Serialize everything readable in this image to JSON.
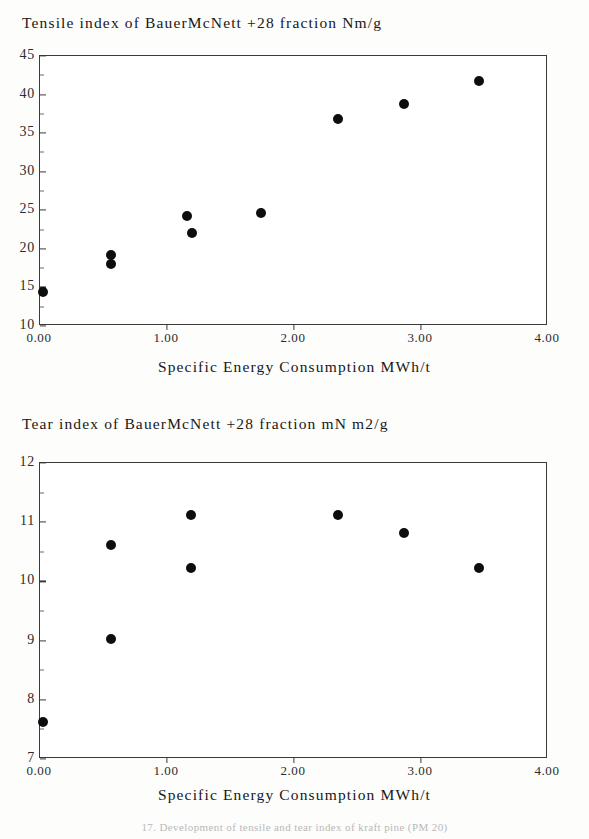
{
  "document": {
    "figure_caption": "17.  Development of tensile and tear index of kraft pine (PM 20)"
  },
  "charts": [
    {
      "id": "tensile",
      "title": "Tensile index of BauerMcNett +28 fraction Nm/g",
      "xlabel": "Specific Energy Consumption MWh/t",
      "yticks": [
        "45",
        "40",
        "35",
        "30",
        "25",
        "20",
        "15",
        "10"
      ],
      "xticks": [
        "0.00",
        "1.00",
        "2.00",
        "3.00",
        "4.00"
      ]
    },
    {
      "id": "tear",
      "title": "Tear index of BauerMcNett +28 fraction mN m2/g",
      "xlabel": "Specific Energy Consumption MWh/t",
      "yticks": [
        "12",
        "11",
        "10",
        "9",
        "8",
        "7"
      ],
      "xticks": [
        "0.00",
        "1.00",
        "2.00",
        "3.00",
        "4.00"
      ]
    }
  ],
  "chart_data": [
    {
      "type": "scatter",
      "title": "Tensile index of BauerMcNett +28 fraction Nm/g",
      "xlabel": "Specific Energy Consumption MWh/t",
      "ylabel": "Tensile index Nm/g",
      "xlim": [
        0.0,
        4.0
      ],
      "ylim": [
        10,
        45
      ],
      "xticks": [
        0.0,
        1.0,
        2.0,
        3.0,
        4.0
      ],
      "xticklabels": [
        "0.00",
        "1.00",
        "2.00",
        "3.00",
        "4.00"
      ],
      "yticks": [
        10,
        15,
        20,
        25,
        30,
        35,
        40,
        45
      ],
      "yticklabels": [
        "10",
        "15",
        "20",
        "25",
        "30",
        "35",
        "40",
        "45"
      ],
      "grid": false,
      "legend": false,
      "marker": "filled-circle",
      "marker_color": "#0d0d0d",
      "points": [
        {
          "x": 0.02,
          "y": 14.4
        },
        {
          "x": 0.56,
          "y": 19.2
        },
        {
          "x": 0.56,
          "y": 18.0
        },
        {
          "x": 1.16,
          "y": 24.3
        },
        {
          "x": 1.2,
          "y": 22.1
        },
        {
          "x": 1.74,
          "y": 24.6
        },
        {
          "x": 2.35,
          "y": 36.8
        },
        {
          "x": 2.87,
          "y": 38.8
        },
        {
          "x": 3.46,
          "y": 41.8
        }
      ]
    },
    {
      "type": "scatter",
      "title": "Tear index of BauerMcNett +28 fraction mN m2/g",
      "xlabel": "Specific Energy Consumption MWh/t",
      "ylabel": "Tear index mN m2/g",
      "xlim": [
        0.0,
        4.0
      ],
      "ylim": [
        7,
        12
      ],
      "xticks": [
        0.0,
        1.0,
        2.0,
        3.0,
        4.0
      ],
      "xticklabels": [
        "0.00",
        "1.00",
        "2.00",
        "3.00",
        "4.00"
      ],
      "yticks": [
        7,
        8,
        9,
        10,
        11,
        12
      ],
      "yticklabels": [
        "7",
        "8",
        "9",
        "10",
        "11",
        "12"
      ],
      "grid": false,
      "legend": false,
      "marker": "filled-circle",
      "marker_color": "#0d0d0d",
      "points": [
        {
          "x": 0.02,
          "y": 7.62
        },
        {
          "x": 0.56,
          "y": 10.62
        },
        {
          "x": 0.56,
          "y": 9.02
        },
        {
          "x": 1.19,
          "y": 11.12
        },
        {
          "x": 1.19,
          "y": 10.22
        },
        {
          "x": 2.35,
          "y": 11.12
        },
        {
          "x": 2.87,
          "y": 10.82
        },
        {
          "x": 3.46,
          "y": 10.22
        }
      ]
    }
  ],
  "colors": {
    "marker": "#0d0d0d",
    "axis": "#3a3a3a",
    "text": "#181818",
    "background": "#fdfdfc"
  }
}
